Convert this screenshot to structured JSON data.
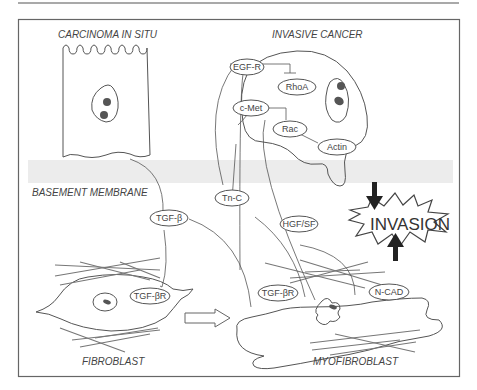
{
  "labels": {
    "carcinoma": "CARCINOMA IN SITU",
    "invasive": "INVASIVE CANCER",
    "basement": "BASEMENT MEMBRANE",
    "fibroblast": "FIBROBLAST",
    "myofibroblast": "MYOFIBROBLAST",
    "invasion": "INVASION"
  },
  "nodes": {
    "egfr": "EGF-R",
    "rhoa": "RhoA",
    "cmet": "c-Met",
    "rac": "Rac",
    "actin": "Actin",
    "tnc": "Tn-C",
    "hgfsf": "HGF/SF",
    "tgfb": "TGF-β",
    "tgfbr1": "TGF-βR",
    "tgfbr2": "TGF-βR",
    "ncad": "N-CAD"
  },
  "colors": {
    "line": "#555555",
    "band": "#e8e8e8",
    "text": "#444444"
  }
}
